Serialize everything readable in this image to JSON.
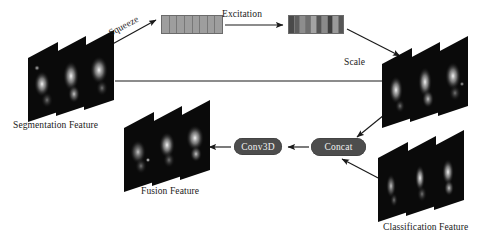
{
  "diagram": {
    "background_color": "#ffffff",
    "width": 494,
    "height": 241
  },
  "labels": {
    "segmentation_feature": "Segmentation Feature",
    "fusion_feature": "Fusion Feature",
    "classification_feature": "Classification Feature",
    "squeeze": "Squeeze",
    "excitation": "Excitation",
    "scale": "Scale"
  },
  "ops": {
    "conv3d": "Conv3D",
    "concat": "Concat",
    "box_fill": "#4d4d4d",
    "box_text_color": "#f2f2f2"
  },
  "vectors": {
    "squeeze_vector": {
      "name": "squeeze-vector",
      "cells": 8,
      "shades": [
        "#9e9e9e",
        "#9e9e9e",
        "#9e9e9e",
        "#9e9e9e",
        "#9e9e9e",
        "#9e9e9e",
        "#9e9e9e",
        "#9e9e9e"
      ],
      "border_color": "#6b6b6b"
    },
    "excitation_vector": {
      "name": "excitation-vector",
      "cells": 10,
      "shades": [
        "#4a4a4a",
        "#5e5e5e",
        "#8d8d8d",
        "#6f6f6f",
        "#a3a3a3",
        "#555555",
        "#8a8a8a",
        "#3f3f3f",
        "#9a9a9a",
        "#565656"
      ],
      "border_color": "#6b6b6b"
    }
  },
  "stacks": {
    "segmentation": {
      "name": "segmentation-feature-stack",
      "slices": 3
    },
    "scaled": {
      "name": "scaled-feature-stack",
      "slices": 3
    },
    "fusion": {
      "name": "fusion-feature-stack",
      "slices": 3
    },
    "classification": {
      "name": "classification-feature-stack",
      "slices": 3
    }
  },
  "arrows": [
    {
      "name": "arrow-squeeze",
      "from": "segmentation-feature-stack",
      "to": "squeeze-vector"
    },
    {
      "name": "arrow-excitation",
      "from": "squeeze-vector",
      "to": "excitation-vector"
    },
    {
      "name": "arrow-scale",
      "from": "excitation-vector",
      "to": "scaled-feature-stack"
    },
    {
      "name": "arrow-segmentation-scale",
      "from": "segmentation-feature-stack",
      "to": "scaled-feature-stack"
    },
    {
      "name": "arrow-scaled-to-concat",
      "from": "scaled-feature-stack",
      "to": "concat"
    },
    {
      "name": "arrow-classification-to-concat",
      "from": "classification-feature-stack",
      "to": "concat"
    },
    {
      "name": "arrow-concat-to-conv3d",
      "from": "concat",
      "to": "conv3d"
    },
    {
      "name": "arrow-conv3d-to-fusion",
      "from": "conv3d",
      "to": "fusion-feature-stack"
    }
  ],
  "colors": {
    "stroke": "#1a1a1a",
    "slice_fill": "#080808",
    "text": "#1a1a1a"
  }
}
